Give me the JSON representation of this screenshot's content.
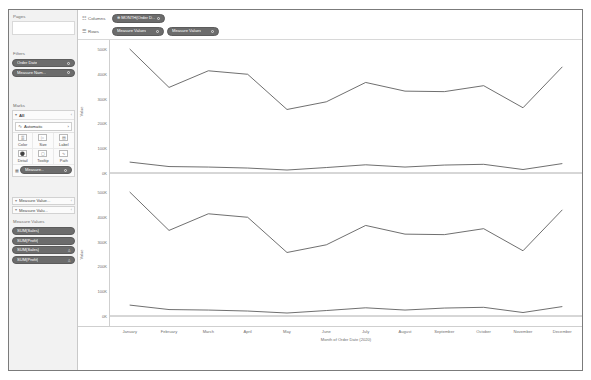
{
  "app": {
    "background": "#ffffff",
    "frame_border": "#7b7b7b",
    "pill_color": "#6c6c6c",
    "text_color": "#6f6f6f"
  },
  "left_panel": {
    "pages": {
      "label": "Pages"
    },
    "filters": {
      "label": "Filters",
      "pills": [
        {
          "label": "Order Date",
          "has_dot": true
        },
        {
          "label": "Measure Nam...",
          "has_dot": true
        }
      ]
    },
    "marks": {
      "label": "Marks",
      "card_title": "All",
      "chevron_icon": "chevron-down-icon",
      "caret_icon": "caret-right-icon",
      "mark_type": "Automatic",
      "mark_type_icon": "line-mark-icon",
      "buttons": [
        {
          "label": "Color",
          "icon": "color-palette-icon",
          "glyph": "▒"
        },
        {
          "label": "Size",
          "icon": "size-icon",
          "glyph": "▷"
        },
        {
          "label": "Label",
          "icon": "label-icon",
          "glyph": "▤"
        },
        {
          "label": "Detail",
          "icon": "detail-icon",
          "glyph": "⛭"
        },
        {
          "label": "Tooltip",
          "icon": "tooltip-icon",
          "glyph": "☐"
        },
        {
          "label": "Path",
          "icon": "path-icon",
          "glyph": "∿"
        }
      ],
      "footer_pill": {
        "label": "Measure...",
        "icon": "color-chip-icon",
        "has_dot": true
      }
    },
    "shelves": [
      {
        "label": "Measure Value...",
        "chevron_icon": "chevron-down-icon",
        "caret_icon": "caret-right-icon"
      },
      {
        "label": "Measure Valu...",
        "chevron_icon": "chevron-down-icon",
        "caret_icon": "caret-right-icon"
      }
    ],
    "measure_values": {
      "label": "Measure Values",
      "pills": [
        {
          "label": "SUM(Sales)",
          "badge": ""
        },
        {
          "label": "SUM(Profit)",
          "badge": ""
        },
        {
          "label": "SUM(Sales)",
          "badge": "△"
        },
        {
          "label": "SUM(Profit)",
          "badge": "△"
        }
      ]
    }
  },
  "shelf_bar": {
    "columns": {
      "label": "Columns",
      "icon": "columns-grid-icon",
      "pills": [
        {
          "label": "⊕ MONTH(Order D...",
          "has_dot": true
        }
      ]
    },
    "rows": {
      "label": "Rows",
      "icon": "rows-grid-icon",
      "pills": [
        {
          "label": "Measure Values",
          "has_dot": true
        },
        {
          "label": "Measure Values",
          "has_dot": true
        }
      ]
    }
  },
  "chart_data": [
    {
      "type": "line",
      "title": "",
      "subtitle": "",
      "panel": "top",
      "xlabel": "Month of Order Date (2020)",
      "ylabel": "Value",
      "categories": [
        "January",
        "February",
        "March",
        "April",
        "May",
        "June",
        "July",
        "August",
        "September",
        "October",
        "November",
        "December"
      ],
      "ytick_labels": [
        "500K",
        "400K",
        "300K",
        "200K",
        "100K",
        "0K"
      ],
      "ytick_values": [
        500000,
        400000,
        300000,
        200000,
        100000,
        0
      ],
      "ylim": [
        0,
        520000
      ],
      "grid": false,
      "legend": "none",
      "series": [
        {
          "name": "SUM(Sales)",
          "color": "#555555",
          "values": [
            500000,
            345000,
            412000,
            398000,
            256000,
            287000,
            365000,
            330000,
            328000,
            352000,
            263000,
            428000
          ]
        },
        {
          "name": "SUM(Profit)",
          "color": "#555555",
          "values": [
            44000,
            26000,
            24000,
            20000,
            12000,
            22000,
            33000,
            24000,
            32000,
            35000,
            14000,
            38000
          ]
        }
      ]
    },
    {
      "type": "line",
      "title": "",
      "subtitle": "",
      "panel": "bottom",
      "xlabel": "Month of Order Date (2020)",
      "ylabel": "Value",
      "categories": [
        "January",
        "February",
        "March",
        "April",
        "May",
        "June",
        "July",
        "August",
        "September",
        "October",
        "November",
        "December"
      ],
      "ytick_labels": [
        "500K",
        "400K",
        "300K",
        "200K",
        "100K",
        "0K"
      ],
      "ytick_values": [
        500000,
        400000,
        300000,
        200000,
        100000,
        0
      ],
      "ylim": [
        0,
        520000
      ],
      "grid": false,
      "legend": "none",
      "series": [
        {
          "name": "SUM(Sales)",
          "color": "#555555",
          "values": [
            500000,
            345000,
            412000,
            398000,
            256000,
            287000,
            365000,
            330000,
            328000,
            352000,
            263000,
            428000
          ]
        },
        {
          "name": "SUM(Profit)",
          "color": "#555555",
          "values": [
            44000,
            26000,
            24000,
            20000,
            12000,
            22000,
            33000,
            24000,
            32000,
            35000,
            14000,
            38000
          ]
        }
      ]
    }
  ],
  "xaxis": {
    "ticks": [
      "January",
      "February",
      "March",
      "April",
      "May",
      "June",
      "July",
      "August",
      "September",
      "October",
      "November",
      "December"
    ],
    "title": "Month of Order Date (2020)"
  }
}
